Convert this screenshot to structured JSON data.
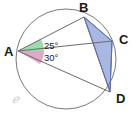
{
  "figure": {
    "type": "circle-geometry-diagram",
    "background_color": "#ffffff",
    "stroke_color": "#6b6b6b",
    "circle": {
      "name": "circumscribed-circle",
      "center_x": 66,
      "center_y": 59,
      "radius": 50,
      "stroke": "#7a7a7a"
    },
    "points": [
      {
        "id": "A",
        "label": "A",
        "x": 18,
        "y": 51,
        "label_x": 4,
        "label_y": 56
      },
      {
        "id": "B",
        "label": "B",
        "x": 84,
        "y": 17,
        "label_x": 79,
        "label_y": 12
      },
      {
        "id": "C",
        "label": "C",
        "x": 112,
        "y": 41,
        "label_x": 119,
        "label_y": 44
      },
      {
        "id": "D",
        "label": "D",
        "x": 110,
        "y": 92,
        "label_x": 116,
        "label_y": 103
      }
    ],
    "segments": [
      {
        "name": "segment-AB",
        "from": "A",
        "to": "B"
      },
      {
        "name": "segment-AC",
        "from": "A",
        "to": "C"
      },
      {
        "name": "segment-AD",
        "from": "A",
        "to": "D"
      },
      {
        "name": "segment-BC",
        "from": "B",
        "to": "C"
      },
      {
        "name": "segment-BD",
        "from": "B",
        "to": "D"
      },
      {
        "name": "segment-CD",
        "from": "C",
        "to": "D"
      }
    ],
    "angles": [
      {
        "name": "angle-BAC",
        "value": "25°",
        "vertex": "A",
        "between": [
          "B",
          "C"
        ],
        "fill_color": "#9fd9ae",
        "label_x": 44,
        "label_y": 49
      },
      {
        "name": "angle-CAD",
        "value": "30°",
        "vertex": "A",
        "between": [
          "C",
          "D"
        ],
        "fill_color": "#e0a8c8",
        "label_x": 44,
        "label_y": 61
      }
    ],
    "shaded_regions": [
      {
        "name": "triangle-BCD-shaded",
        "vertices": [
          "B",
          "C",
          "D"
        ],
        "fill_color": "#a8b8e0",
        "stroke_color": "#5c6fa8"
      }
    ],
    "watermark": {
      "name": "script-c-watermark",
      "text": "ℯ",
      "x": 12,
      "y": 103,
      "color": "#c9c9c9"
    }
  }
}
